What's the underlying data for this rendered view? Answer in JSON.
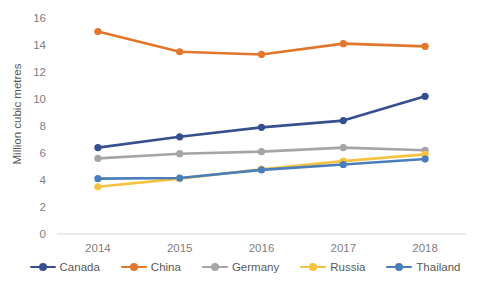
{
  "chart_data": {
    "type": "line",
    "title": "",
    "xlabel": "",
    "ylabel": "Million cubic metres",
    "categories": [
      "2014",
      "2015",
      "2016",
      "2017",
      "2018"
    ],
    "ylim": [
      0,
      16
    ],
    "ytick_step": 2,
    "yticks": [
      "0",
      "2",
      "4",
      "6",
      "8",
      "10",
      "12",
      "14",
      "16"
    ],
    "grid": false,
    "legend_position": "bottom",
    "markers": true,
    "series": [
      {
        "name": "Canada",
        "color": "#36508F",
        "values": [
          6.4,
          7.2,
          7.9,
          8.4,
          10.2
        ]
      },
      {
        "name": "China",
        "color": "#E2762B",
        "values": [
          15.0,
          13.5,
          13.3,
          14.1,
          13.9
        ]
      },
      {
        "name": "Germany",
        "color": "#A5A5A5",
        "values": [
          5.6,
          5.95,
          6.1,
          6.4,
          6.2
        ]
      },
      {
        "name": "Russia",
        "color": "#F5C242",
        "values": [
          3.5,
          4.1,
          4.8,
          5.4,
          5.9
        ]
      },
      {
        "name": "Thailand",
        "color": "#4A7EBB",
        "values": [
          4.1,
          4.15,
          4.75,
          5.15,
          5.55
        ]
      }
    ]
  }
}
